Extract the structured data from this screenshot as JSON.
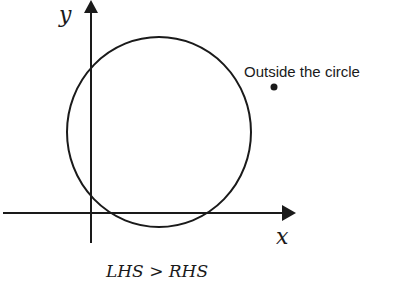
{
  "diagram": {
    "axes": {
      "x_label": "x",
      "y_label": "y"
    },
    "circle": {
      "cx": 159,
      "cy": 132,
      "rx": 92,
      "ry": 95
    },
    "point": {
      "label": "Outside the circle",
      "x": 274,
      "y": 87
    },
    "caption": "LHS > RHS",
    "colors": {
      "stroke": "#1a1a1a",
      "background": "#ffffff"
    }
  }
}
